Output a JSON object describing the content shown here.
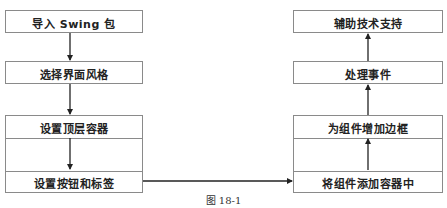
{
  "diagram": {
    "left_column": [
      {
        "id": "import-swing",
        "label": "导入 Swing 包"
      },
      {
        "id": "choose-look",
        "label": "选择界面风格"
      },
      {
        "id": "set-top-container",
        "label": "设置顶层容器"
      },
      {
        "id": "set-buttons-labels",
        "label": "设置按钮和标签"
      }
    ],
    "right_column": [
      {
        "id": "aux-tech",
        "label": "辅助技术支持"
      },
      {
        "id": "handle-events",
        "label": "处理事件"
      },
      {
        "id": "add-border",
        "label": "为组件增加边框"
      },
      {
        "id": "add-to-container",
        "label": "将组件添加容器中"
      }
    ],
    "edges": [
      {
        "from": "import-swing",
        "to": "choose-look"
      },
      {
        "from": "choose-look",
        "to": "set-top-container"
      },
      {
        "from": "set-top-container",
        "to": "set-buttons-labels"
      },
      {
        "from": "set-buttons-labels",
        "to": "add-to-container"
      },
      {
        "from": "add-to-container",
        "to": "add-border"
      },
      {
        "from": "add-border",
        "to": "handle-events"
      },
      {
        "from": "handle-events",
        "to": "aux-tech"
      }
    ],
    "caption": "图 18-1"
  }
}
